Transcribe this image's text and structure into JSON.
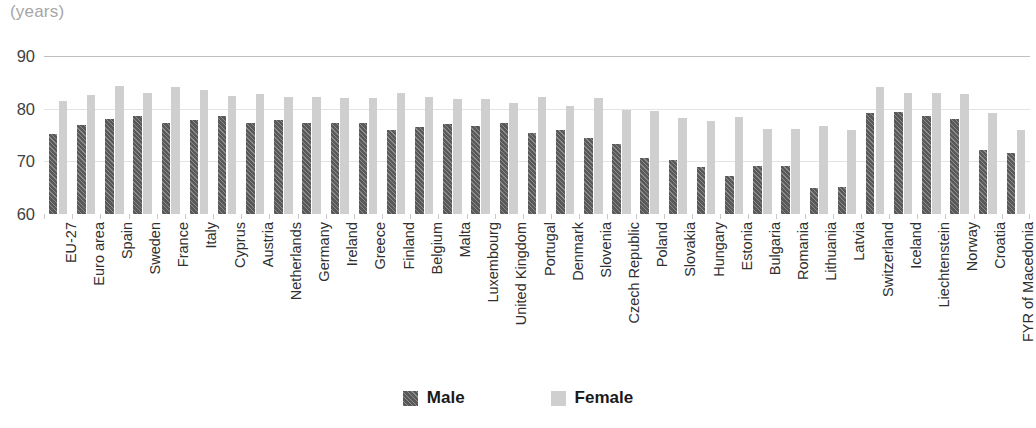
{
  "axis_unit_title": "(years)",
  "legend": {
    "items": [
      {
        "label": "Male",
        "color": "#595959",
        "pattern": "diagonal-hatch"
      },
      {
        "label": "Female",
        "color": "#cfcfcf",
        "pattern": "solid"
      }
    ]
  },
  "colors": {
    "male": "#595959",
    "female": "#cfcfcf",
    "gridline": "#e3e3e3",
    "axis_label": "#3f3f3f",
    "unit_title": "#a6a6a6",
    "category_label": "#2f2f2f"
  },
  "chart_data": {
    "type": "bar",
    "title": "",
    "subtitle": "",
    "xlabel": "",
    "ylabel": "(years)",
    "ylim": [
      60,
      90
    ],
    "yticks": [
      60,
      70,
      80,
      90
    ],
    "ytick_labels": [
      "60",
      "70",
      "80",
      "90"
    ],
    "grid": true,
    "legend_position": "bottom-center",
    "orientation": "vertical",
    "grouping": "clustered",
    "categories": [
      "EU-27",
      "Euro area",
      "Spain",
      "Sweden",
      "France",
      "Italy",
      "Cyprus",
      "Austria",
      "Netherlands",
      "Germany",
      "Ireland",
      "Greece",
      "Finland",
      "Belgium",
      "Malta",
      "Luxembourg",
      "United Kingdom",
      "Portugal",
      "Denmark",
      "Slovenia",
      "Czech Republic",
      "Poland",
      "Slovakia",
      "Hungary",
      "Estonia",
      "Bulgaria",
      "Romania",
      "Lithuania",
      "Latvia",
      "Switzerland",
      "Iceland",
      "Liechtenstein",
      "Norway",
      "Croatia",
      "FYR of Macedonia"
    ],
    "series": [
      {
        "name": "Male",
        "color": "#595959",
        "values": [
          75.1,
          76.9,
          78.0,
          78.7,
          77.3,
          77.9,
          78.7,
          77.2,
          77.9,
          77.2,
          77.3,
          77.3,
          75.9,
          76.6,
          77.0,
          76.8,
          77.2,
          75.4,
          76.0,
          74.4,
          73.3,
          70.6,
          70.2,
          69.0,
          67.2,
          69.1,
          69.2,
          65.0,
          65.1,
          79.1,
          79.4,
          78.6,
          78.0,
          72.2,
          71.5
        ]
      },
      {
        "name": "Female",
        "color": "#cfcfcf",
        "values": [
          81.4,
          82.6,
          84.3,
          82.9,
          84.2,
          83.6,
          82.5,
          82.7,
          82.2,
          82.3,
          82.1,
          82.0,
          82.9,
          82.3,
          81.8,
          81.9,
          81.1,
          82.2,
          80.6,
          82.0,
          79.8,
          79.6,
          78.2,
          77.6,
          78.4,
          76.2,
          76.2,
          76.7,
          76.0,
          84.1,
          82.9,
          82.9,
          82.8,
          79.1,
          76.0
        ]
      }
    ]
  }
}
